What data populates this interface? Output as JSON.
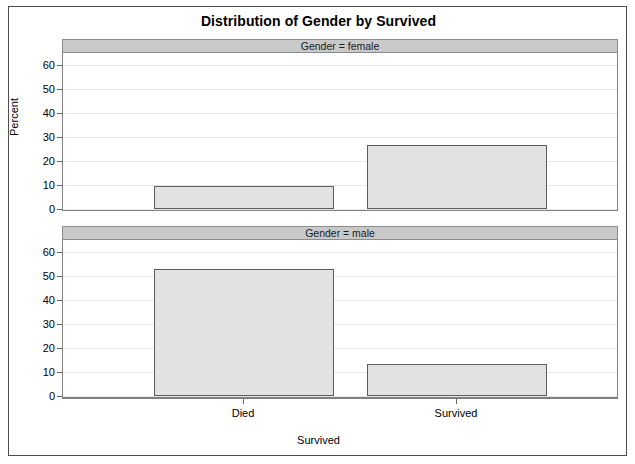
{
  "chart_data": {
    "type": "bar",
    "title": "Distribution of Gender by Survived",
    "xlabel": "Survived",
    "ylabel": "Percent",
    "categories": [
      "Died",
      "Survived"
    ],
    "ylim": [
      0,
      65
    ],
    "yticks": [
      0,
      10,
      20,
      30,
      40,
      50,
      60
    ],
    "grid": true,
    "legend": null,
    "panel_variable": "Gender",
    "panels": [
      {
        "strip_label": "Gender = female",
        "panel_value": "female",
        "values": [
          9.5,
          26.5
        ]
      },
      {
        "strip_label": "Gender = male",
        "panel_value": "male",
        "values": [
          53.0,
          13.5
        ]
      }
    ],
    "colors": {
      "bar_fill": "#e2e2e2",
      "bar_border": "#5c5c5c",
      "strip_fill": "#c9c9c9",
      "gridline": "#e8e8e8",
      "frame": "#4d4d4d",
      "background": "#ffffff"
    }
  },
  "ytick_labels": [
    "60",
    "50",
    "40",
    "30",
    "20",
    "10",
    "0"
  ]
}
